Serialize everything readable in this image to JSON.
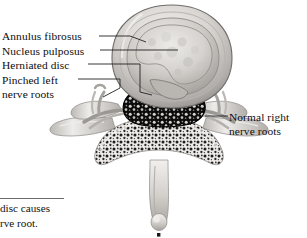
{
  "figure": {
    "type": "medical-illustration",
    "palette": {
      "background": "#ffffff",
      "ink": "#0d0d0d",
      "leader_line": "#2b2b2b",
      "disc_outer_light": "#e9e7e4",
      "disc_outer_mid": "#b9b6b2",
      "disc_outer_dark": "#7d7a77",
      "nucleus_light": "#dedbd7",
      "nucleus_mid": "#c2bfbb",
      "bone_light": "#f0eeec",
      "bone_mid": "#c9c6c2",
      "bone_dark": "#8f8c88",
      "canal_dark": "#111111",
      "rule": "#6b6b6b"
    }
  },
  "labels": {
    "annulus": "Annulus fibrosus",
    "nucleus": "Nucleus pulposus",
    "herniated": "Herniated disc",
    "pinched_line1": "Pinched left",
    "pinched_line2": "nerve roots",
    "normal_line1": "Normal right",
    "normal_line2": "nerve roots"
  },
  "caption": {
    "line1": "disc causes",
    "line2": "rve root."
  }
}
